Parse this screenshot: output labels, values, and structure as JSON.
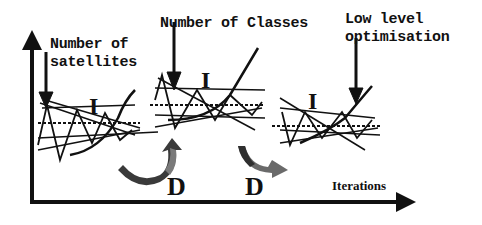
{
  "diagram": {
    "axis": {
      "x_label": "Iterations"
    },
    "annotations": {
      "satellites_line1": "Number of",
      "satellites_line2": "satellites",
      "classes": "Number of Classes",
      "lowlevel_line1": "Low level",
      "lowlevel_line2": "optimisation"
    },
    "panels": [
      {
        "id": "panel-1",
        "label": "I"
      },
      {
        "id": "panel-2",
        "label": "I"
      },
      {
        "id": "panel-3",
        "label": "I"
      }
    ],
    "transitions": [
      {
        "id": "transition-1",
        "label": "D"
      },
      {
        "id": "transition-2",
        "label": "D"
      }
    ],
    "colors": {
      "ink": "#111111",
      "arrow_dark": "#3a3a3a",
      "arrow_mid": "#7a7a7a"
    }
  }
}
